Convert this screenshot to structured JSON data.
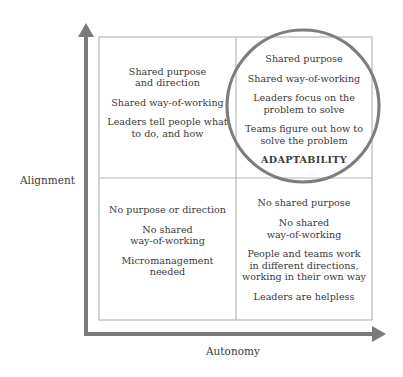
{
  "diagram": {
    "type": "2x2 matrix",
    "axes": {
      "y_label": "Alignment",
      "x_label": "Autonomy"
    },
    "quadrants": {
      "top_left": {
        "position": "high alignment, low autonomy",
        "lines": [
          "Shared purpose\nand direction",
          "Shared way-of-working",
          "Leaders tell people what\nto do, and how"
        ]
      },
      "top_right": {
        "position": "high alignment, high autonomy",
        "highlighted": true,
        "lines": [
          "Shared purpose",
          "Shared way-of-working",
          "Leaders focus on the\nproblem to solve",
          "Teams figure out how to\nsolve the problem"
        ],
        "emphasis": "ADAPTABILITY"
      },
      "bottom_left": {
        "position": "low alignment, low autonomy",
        "lines": [
          "No purpose or direction",
          "No shared\nway-of-working",
          "Micromanagement\nneeded"
        ]
      },
      "bottom_right": {
        "position": "low alignment, high autonomy",
        "lines": [
          "No shared purpose",
          "No shared\nway-of-working",
          "People and teams work\nin different directions,\nworking in their own way",
          "Leaders are helpless"
        ]
      }
    },
    "colors": {
      "axis": "#7a7a7a",
      "grid": "#b8b8b8",
      "circle": "#7d7d7d",
      "text": "#3a3a3a"
    }
  }
}
